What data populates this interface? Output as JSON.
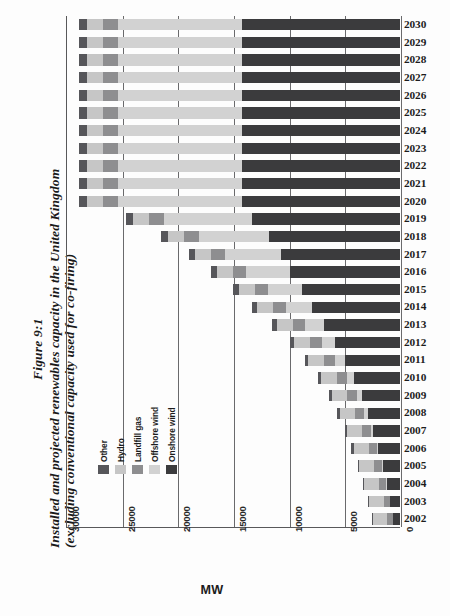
{
  "figure": {
    "number": "Figure 9:1",
    "title_line_1": "Installed and projected renewables capacity in the United Kingdom",
    "title_line_2": "(excluding conventional capacity used for co-firing)"
  },
  "chart_data": {
    "type": "bar",
    "orientation": "horizontal",
    "stacked": true,
    "title": "Installed and projected renewables capacity in the United Kingdom (excluding conventional capacity used for co-firing)",
    "xlabel": "MW",
    "ylabel": "",
    "xlim": [
      30000,
      0
    ],
    "x_axis_reversed": true,
    "xticks": [
      30000,
      25000,
      20000,
      15000,
      10000,
      5000,
      0
    ],
    "xticklabels": [
      "30000",
      "25000",
      "20000",
      "15000",
      "10000",
      "5000",
      "0"
    ],
    "grid": true,
    "legend_position": "inner-left",
    "categories": [
      "2030",
      "2029",
      "2028",
      "2027",
      "2026",
      "2025",
      "2024",
      "2023",
      "2022",
      "2021",
      "2020",
      "2019",
      "2018",
      "2017",
      "2016",
      "2015",
      "2014",
      "2013",
      "2012",
      "2011",
      "2010",
      "2009",
      "2008",
      "2007",
      "2006",
      "2005",
      "2004",
      "2003",
      "2002"
    ],
    "series": [
      {
        "name": "Onshore wind",
        "color": "#3b3b3d",
        "values": [
          14200,
          14200,
          14200,
          14200,
          14200,
          14200,
          14200,
          14200,
          14200,
          14200,
          14200,
          13300,
          11800,
          10700,
          9900,
          8800,
          7900,
          6800,
          5800,
          4950,
          4150,
          3450,
          2900,
          2400,
          1950,
          1550,
          1200,
          870,
          620
        ]
      },
      {
        "name": "Offshore wind",
        "color": "#d2d2d2",
        "values": [
          11100,
          11100,
          11100,
          11100,
          11100,
          11100,
          11100,
          11100,
          11100,
          11100,
          11100,
          7900,
          6300,
          5000,
          3900,
          3050,
          2350,
          1750,
          1250,
          880,
          600,
          420,
          300,
          210,
          150,
          100,
          70,
          50,
          30
        ]
      },
      {
        "name": "Landfill gas",
        "color": "#8e8e90",
        "values": [
          1350,
          1350,
          1350,
          1350,
          1350,
          1350,
          1350,
          1350,
          1350,
          1350,
          1350,
          1320,
          1290,
          1260,
          1230,
          1190,
          1150,
          1100,
          1050,
          1000,
          950,
          900,
          850,
          790,
          730,
          670,
          600,
          540,
          480
        ]
      },
      {
        "name": "Hydro",
        "color": "#c6c6c6",
        "values": [
          1500,
          1500,
          1500,
          1500,
          1500,
          1500,
          1500,
          1500,
          1500,
          1500,
          1500,
          1480,
          1470,
          1460,
          1450,
          1440,
          1430,
          1420,
          1410,
          1400,
          1390,
          1380,
          1370,
          1360,
          1350,
          1340,
          1330,
          1320,
          1300
        ]
      },
      {
        "name": "Other",
        "color": "#56565a",
        "values": [
          700,
          700,
          700,
          700,
          700,
          700,
          700,
          700,
          700,
          700,
          700,
          660,
          620,
          580,
          540,
          500,
          460,
          420,
          380,
          340,
          300,
          270,
          240,
          210,
          185,
          160,
          140,
          120,
          100
        ]
      }
    ],
    "legend_entries": [
      {
        "label": "Other",
        "color": "#56565a"
      },
      {
        "label": "Hydro",
        "color": "#c6c6c6"
      },
      {
        "label": "Landfill gas",
        "color": "#8e8e90"
      },
      {
        "label": "Offshore wind",
        "color": "#d2d2d2"
      },
      {
        "label": "Onshore wind",
        "color": "#3b3b3d"
      }
    ]
  }
}
